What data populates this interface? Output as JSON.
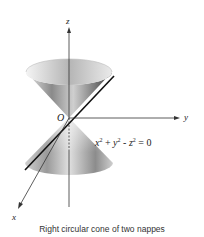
{
  "figure": {
    "axes": {
      "z_label": "z",
      "y_label": "y",
      "x_label": "x",
      "origin_label": "O"
    },
    "equation": {
      "x_term": "x",
      "y_term": "y",
      "z_term": "z",
      "exponent": "2",
      "plus": " + ",
      "minus": " - ",
      "rhs": " = 0"
    },
    "caption": "Right circular cone of two nappes"
  }
}
